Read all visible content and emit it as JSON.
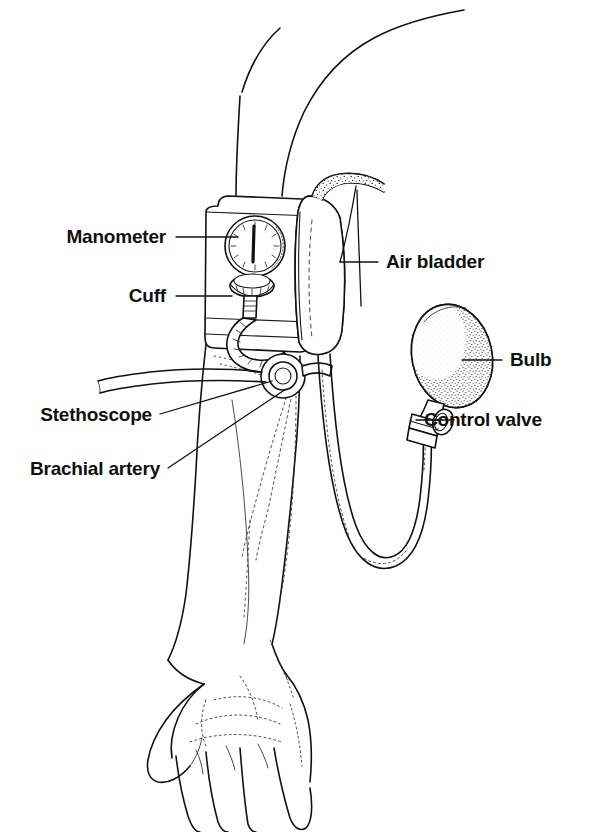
{
  "figure": {
    "style": "black-and-white line drawing with stipple shading",
    "background_color": "#ffffff",
    "ink_color": "#111111",
    "width": 614,
    "height": 832
  },
  "labels": [
    {
      "id": "manometer",
      "text": "Manometer",
      "side": "left",
      "text_x": 166,
      "text_y": 243,
      "leader": "M 176 237 L 238 237"
    },
    {
      "id": "cuff",
      "text": "Cuff",
      "side": "left",
      "text_x": 166,
      "text_y": 302,
      "leader": "M 176 296 L 232 296"
    },
    {
      "id": "stethoscope",
      "text": "Stethoscope",
      "side": "left",
      "text_x": 152,
      "text_y": 421,
      "leader": "M 160 414 L 272 381"
    },
    {
      "id": "brachial-artery",
      "text": "Brachial artery",
      "side": "left",
      "text_x": 160,
      "text_y": 475,
      "leader": "M 168 468 L 286 389"
    },
    {
      "id": "air-bladder",
      "text": "Air bladder",
      "side": "right",
      "text_x": 386,
      "text_y": 268,
      "leader": "M 340 262 L 378 262"
    },
    {
      "id": "bulb",
      "text": "Bulb",
      "side": "right",
      "text_x": 510,
      "text_y": 366,
      "leader": "M 462 360 L 502 360"
    },
    {
      "id": "control-valve",
      "text": "Control valve",
      "side": "right",
      "text_x": 424,
      "text_y": 426,
      "leader": "M 375 420 L 416 420"
    }
  ],
  "parts": [
    {
      "id": "arm",
      "name": "upper arm and forearm"
    },
    {
      "id": "hand",
      "name": "open hand with fingers"
    },
    {
      "id": "cuff-body",
      "name": "inflatable cuff wrapped around upper arm"
    },
    {
      "id": "manometer-dial",
      "name": "round pressure gauge with needle"
    },
    {
      "id": "air-bladder-tube",
      "name": "shaded air bladder along cuff edge"
    },
    {
      "id": "stethoscope-head",
      "name": "stethoscope chestpiece ring"
    },
    {
      "id": "stethoscope-tubing",
      "name": "stethoscope tubing to the left"
    },
    {
      "id": "brachial-vessels",
      "name": "stippled artery lines along forearm"
    },
    {
      "id": "rubber-bulb",
      "name": "inflation bulb"
    },
    {
      "id": "valve-knob",
      "name": "control valve thumbscrew"
    },
    {
      "id": "connector-tube",
      "name": "u-shaped rubber tube from cuff to bulb"
    }
  ]
}
